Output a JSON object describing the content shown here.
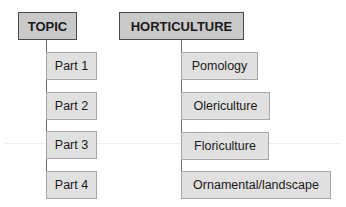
{
  "diagram": {
    "columns": [
      {
        "header": "TOPIC",
        "items": [
          "Part 1",
          "Part 2",
          "Part 3",
          "Part 4"
        ]
      },
      {
        "header": "HORTICULTURE",
        "items": [
          "Pomology",
          "Olericulture",
          "Floriculture",
          "Ornamental/landscape"
        ]
      }
    ],
    "colors": {
      "header_fill": "#c9c9c9",
      "item_fill": "#e0e0e0",
      "connector": "#6e6e6e"
    }
  }
}
